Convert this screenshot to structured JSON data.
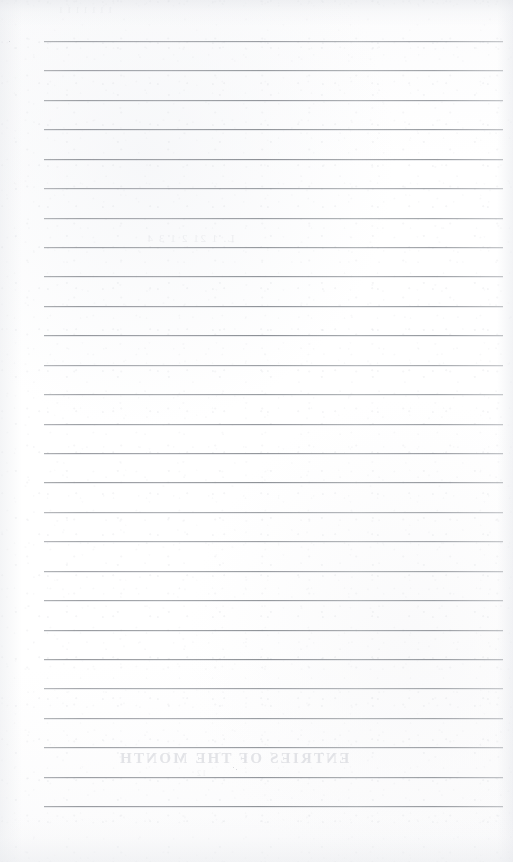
{
  "document": {
    "kind": "scanned-lined-paper",
    "title": "Blank ruled notebook page",
    "page_width": 513,
    "page_height": 862,
    "background_color": "#fdfdfd",
    "rule_color": "#8b8e94",
    "rule_shadow_color": "#cdd0d5",
    "ghost_text_color": "#c4c7cd",
    "content_text": ""
  },
  "ruling": {
    "line_count": 27,
    "first_line_y": 41,
    "line_spacing": 29.4,
    "line_left_x": 44,
    "line_right_x": 503,
    "line_thickness": 1,
    "has_left_margin_rule": false,
    "has_header_rule": false
  },
  "rules": [
    {
      "index": 1,
      "y": 41,
      "label": "rule-line-1"
    },
    {
      "index": 2,
      "y": 70,
      "label": "rule-line-2"
    },
    {
      "index": 3,
      "y": 100,
      "label": "rule-line-3"
    },
    {
      "index": 4,
      "y": 129,
      "label": "rule-line-4"
    },
    {
      "index": 5,
      "y": 159,
      "label": "rule-line-5"
    },
    {
      "index": 6,
      "y": 188,
      "label": "rule-line-6"
    },
    {
      "index": 7,
      "y": 218,
      "label": "rule-line-7"
    },
    {
      "index": 8,
      "y": 247,
      "label": "rule-line-8"
    },
    {
      "index": 9,
      "y": 276,
      "label": "rule-line-9"
    },
    {
      "index": 10,
      "y": 306,
      "label": "rule-line-10"
    },
    {
      "index": 11,
      "y": 335,
      "label": "rule-line-11"
    },
    {
      "index": 12,
      "y": 365,
      "label": "rule-line-12"
    },
    {
      "index": 13,
      "y": 394,
      "label": "rule-line-13"
    },
    {
      "index": 14,
      "y": 424,
      "label": "rule-line-14"
    },
    {
      "index": 15,
      "y": 453,
      "label": "rule-line-15"
    },
    {
      "index": 16,
      "y": 482,
      "label": "rule-line-16"
    },
    {
      "index": 17,
      "y": 512,
      "label": "rule-line-17"
    },
    {
      "index": 18,
      "y": 541,
      "label": "rule-line-18"
    },
    {
      "index": 19,
      "y": 571,
      "label": "rule-line-19"
    },
    {
      "index": 20,
      "y": 600,
      "label": "rule-line-20"
    },
    {
      "index": 21,
      "y": 630,
      "label": "rule-line-21"
    },
    {
      "index": 22,
      "y": 659,
      "label": "rule-line-22"
    },
    {
      "index": 23,
      "y": 688,
      "label": "rule-line-23"
    },
    {
      "index": 24,
      "y": 718,
      "label": "rule-line-24"
    },
    {
      "index": 25,
      "y": 747,
      "label": "rule-line-25"
    },
    {
      "index": 26,
      "y": 777,
      "label": "rule-line-26"
    },
    {
      "index": 27,
      "y": 806,
      "label": "rule-line-27"
    }
  ],
  "show_through": {
    "description": "Faint mirrored text bleeding through from the reverse side of the sheet",
    "blocks": [
      {
        "id": "ghost-bottom-title",
        "x": 118,
        "y": 750,
        "text": "ENTRIES OF THE MONTH",
        "size": "title"
      },
      {
        "id": "ghost-bottom-sub",
        "x": 196,
        "y": 769,
        "text": "12",
        "size": "small"
      },
      {
        "id": "ghost-mid-row",
        "x": 146,
        "y": 232,
        "text": "L. 1  21 2  1  3  4",
        "size": "mid"
      },
      {
        "id": "ghost-top-band",
        "x": 58,
        "y": 6,
        "text": "1   1 1    1 1  1   1",
        "size": "small"
      }
    ]
  },
  "artifacts": {
    "top_smudge": true,
    "bottom_smudge": true,
    "left_edge_shadow": true,
    "right_edge_shadow": true,
    "specks": [
      {
        "x": 233,
        "y": 767,
        "size": 1.4
      },
      {
        "x": 236,
        "y": 769,
        "size": 1.1
      },
      {
        "x": 9,
        "y": 41,
        "size": 1.2
      }
    ]
  }
}
